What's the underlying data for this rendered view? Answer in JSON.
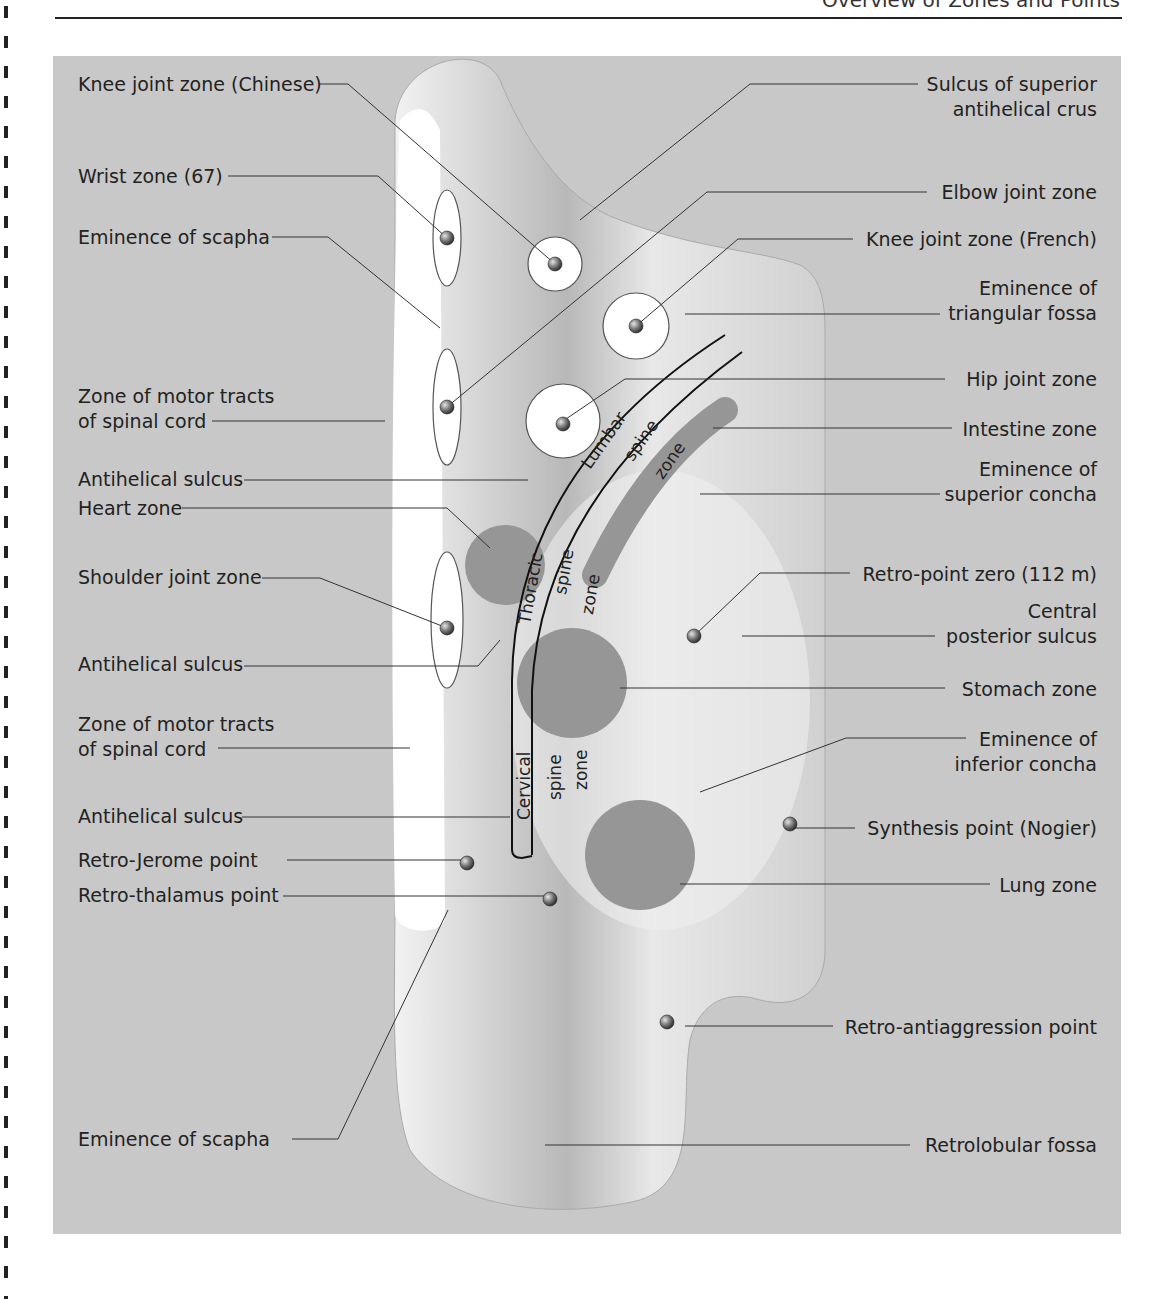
{
  "page": {
    "header_title": "Overview of Zones and Points"
  },
  "figure": {
    "background_color": "#c8c8c8",
    "zone_fill_color": "#969696",
    "zone_circle_color": "#ffffff",
    "spine_zones": {
      "lumbar": [
        "Lumbar",
        "spine",
        "zone"
      ],
      "thoracic": [
        "Thoracic",
        "spine",
        "zone"
      ],
      "cervical": [
        "Cervical",
        "spine",
        "zone"
      ]
    },
    "labels_left": [
      {
        "id": "knee-joint-zone-chinese",
        "lines": [
          "Knee joint zone (Chinese)"
        ]
      },
      {
        "id": "wrist-zone",
        "lines": [
          "Wrist zone (67)"
        ]
      },
      {
        "id": "eminence-of-scapha-upper",
        "lines": [
          "Eminence of scapha"
        ]
      },
      {
        "id": "zone-of-motor-tracts-upper",
        "lines": [
          "Zone of motor tracts",
          "of spinal cord"
        ]
      },
      {
        "id": "antihelical-sulcus-1",
        "lines": [
          "Antihelical sulcus"
        ]
      },
      {
        "id": "heart-zone",
        "lines": [
          "Heart zone"
        ]
      },
      {
        "id": "shoulder-joint-zone",
        "lines": [
          "Shoulder joint zone"
        ]
      },
      {
        "id": "antihelical-sulcus-2",
        "lines": [
          "Antihelical sulcus"
        ]
      },
      {
        "id": "zone-of-motor-tracts-lower",
        "lines": [
          "Zone of motor tracts",
          "of spinal cord"
        ]
      },
      {
        "id": "antihelical-sulcus-3",
        "lines": [
          "Antihelical sulcus"
        ]
      },
      {
        "id": "retro-jerome-point",
        "lines": [
          "Retro-Jerome point"
        ]
      },
      {
        "id": "retro-thalamus-point",
        "lines": [
          "Retro-thalamus point"
        ]
      },
      {
        "id": "eminence-of-scapha-lower",
        "lines": [
          "Eminence of scapha"
        ]
      }
    ],
    "labels_right": [
      {
        "id": "sulcus-superior-antihelical-crus",
        "lines": [
          "Sulcus of superior",
          "antihelical crus"
        ]
      },
      {
        "id": "elbow-joint-zone",
        "lines": [
          "Elbow joint zone"
        ]
      },
      {
        "id": "knee-joint-zone-french",
        "lines": [
          "Knee joint zone (French)"
        ]
      },
      {
        "id": "eminence-triangular-fossa",
        "lines": [
          "Eminence of",
          "triangular fossa"
        ]
      },
      {
        "id": "hip-joint-zone",
        "lines": [
          "Hip joint zone"
        ]
      },
      {
        "id": "intestine-zone",
        "lines": [
          "Intestine zone"
        ]
      },
      {
        "id": "eminence-superior-concha",
        "lines": [
          "Eminence of",
          "superior concha"
        ]
      },
      {
        "id": "retro-point-zero",
        "lines": [
          "Retro-point zero (112 m)"
        ]
      },
      {
        "id": "central-posterior-sulcus",
        "lines": [
          "Central",
          "posterior sulcus"
        ]
      },
      {
        "id": "stomach-zone",
        "lines": [
          "Stomach zone"
        ]
      },
      {
        "id": "eminence-inferior-concha",
        "lines": [
          "Eminence of",
          "inferior concha"
        ]
      },
      {
        "id": "synthesis-point",
        "lines": [
          "Synthesis point (Nogier)"
        ]
      },
      {
        "id": "lung-zone",
        "lines": [
          "Lung zone"
        ]
      },
      {
        "id": "retro-antiaggression-point",
        "lines": [
          "Retro-antiaggression point"
        ]
      },
      {
        "id": "retrolobular-fossa",
        "lines": [
          "Retrolobular fossa"
        ]
      }
    ]
  }
}
